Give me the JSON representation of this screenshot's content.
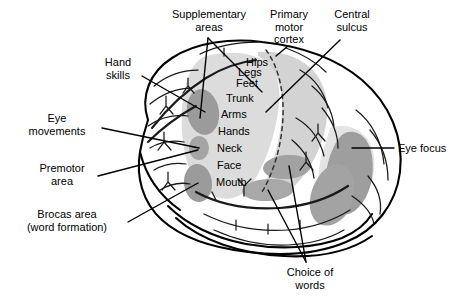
{
  "figure": {
    "kind": "anatomical-diagram"
  },
  "colors": {
    "outline": "#000000",
    "background": "#ffffff",
    "motor_strip_band": "#dcdcdc",
    "primary_motor_band": "#d0d0d0",
    "blob_dark": "#9a9a9a",
    "blob_mid": "#a8a8a8",
    "sulci_line": "#1a1a1a",
    "text": "#000000"
  },
  "callouts": [
    {
      "id": "supplementary-areas",
      "label": "Supplementary\nareas",
      "x": 166,
      "y": 8,
      "width": 86,
      "align": "center"
    },
    {
      "id": "primary-motor-cortex",
      "label": "Primary\nmotor\ncortex",
      "x": 258,
      "y": 8,
      "width": 62,
      "align": "center"
    },
    {
      "id": "central-sulcus",
      "label": "Central\nsulcus",
      "x": 322,
      "y": 8,
      "width": 60,
      "align": "center"
    },
    {
      "id": "hand-skills",
      "label": "Hand\nskills",
      "x": 92,
      "y": 56,
      "width": 52,
      "align": "center"
    },
    {
      "id": "eye-movements",
      "label": "Eye\nmovements",
      "x": 14,
      "y": 112,
      "width": 86,
      "align": "center"
    },
    {
      "id": "premotor-area",
      "label": "Premotor\narea",
      "x": 28,
      "y": 162,
      "width": 68,
      "align": "center"
    },
    {
      "id": "brocas-area",
      "label": "Brocas area\n(word formation)",
      "x": 8,
      "y": 208,
      "width": 118,
      "align": "center"
    },
    {
      "id": "eye-focus",
      "label": "Eye focus",
      "x": 398,
      "y": 142,
      "width": 58,
      "align": "left"
    },
    {
      "id": "choice-of-words",
      "label": "Choice of\nwords",
      "x": 274,
      "y": 266,
      "width": 72,
      "align": "center"
    }
  ],
  "homunculus": {
    "title": "motor homunculus body-part sequence",
    "labels": [
      {
        "id": "hips",
        "text": "Hips",
        "x": 246,
        "y": 56
      },
      {
        "id": "legs",
        "text": "Legs",
        "x": 238,
        "y": 66
      },
      {
        "id": "feet",
        "text": "Feet",
        "x": 236,
        "y": 77
      },
      {
        "id": "trunk",
        "text": "Trunk",
        "x": 226,
        "y": 92
      },
      {
        "id": "arms",
        "text": "Arms",
        "x": 221,
        "y": 108
      },
      {
        "id": "hands",
        "text": "Hands",
        "x": 218,
        "y": 125
      },
      {
        "id": "neck",
        "text": "Neck",
        "x": 217,
        "y": 142
      },
      {
        "id": "face",
        "text": "Face",
        "x": 217,
        "y": 159
      },
      {
        "id": "mouth",
        "text": "Mouth",
        "x": 216,
        "y": 176
      }
    ]
  },
  "regions": [
    {
      "id": "motor-strip-band",
      "shade": "light",
      "note": "broad light band running down the precentral/postcentral region"
    },
    {
      "id": "primary-motor-band",
      "shade": "light",
      "note": "light band right of the dashed central sulcus line"
    },
    {
      "id": "hand-skills-blob",
      "shade": "dark",
      "note": "upper dark oval in premotor strip"
    },
    {
      "id": "eye-movements-blob",
      "shade": "dark",
      "note": "small middle dark oval in premotor strip"
    },
    {
      "id": "premotor-area-blob",
      "shade": "dark",
      "note": "lower dark oval in premotor strip"
    },
    {
      "id": "choice-of-words-blob-a",
      "shade": "dark",
      "note": "upper horizontal oval in temporal/parietal junction"
    },
    {
      "id": "choice-of-words-blob-b",
      "shade": "dark",
      "note": "lower horizontal oval in temporal/parietal junction"
    },
    {
      "id": "eye-focus-blob",
      "shade": "dark",
      "note": "large occipital dark region"
    }
  ]
}
